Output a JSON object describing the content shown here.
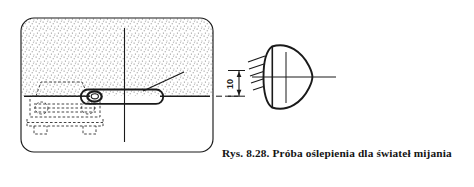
{
  "figure": {
    "caption": "Rys. 8.28. Próba oślepienia dla świateł mijania",
    "panel": {
      "name": "test-scene-panel",
      "fill_description": "stippled-gray-upper-half",
      "stipple_color": "#9a9a9a",
      "border_color": "#1a1a1a",
      "background_color": "#ffffff"
    },
    "dimension": {
      "label": "10",
      "orientation": "vertical",
      "rotated_degrees": -90
    },
    "elements": {
      "vehicle_label": "vehicle-front-view-dashed",
      "headlamp_label": "headlamp-marker",
      "beam_label": "light-beam-capsule",
      "leader_label": "leader-line",
      "lamp_label": "observer-headlamp",
      "rays_label": "light-rays",
      "axis_h_label": "horizontal-axis-line",
      "axis_v_label": "vertical-axis-line",
      "ground_label": "ground-reference-line"
    },
    "colors": {
      "ink": "#1a1a1a",
      "stipple": "#8d8d8d",
      "dashed": "#3a3a3a"
    }
  }
}
